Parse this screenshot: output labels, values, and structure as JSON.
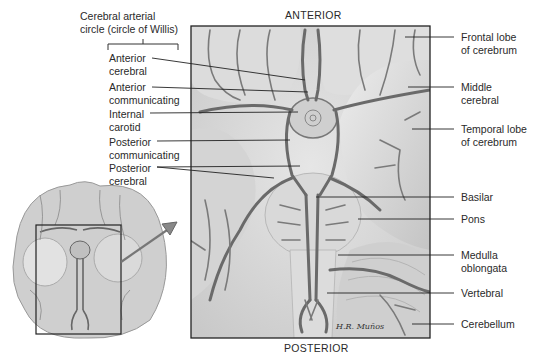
{
  "diagram": {
    "orientation": {
      "top": "ANTERIOR",
      "bottom": "POSTERIOR"
    },
    "group_title": "Cerebral arterial circle (circle of Willis)",
    "group_title_lines": [
      "Cerebral arterial",
      "circle (circle of Willis)"
    ],
    "left_labels": [
      {
        "lines": [
          "Anterior",
          "cerebral"
        ]
      },
      {
        "lines": [
          "Anterior",
          "communicating"
        ]
      },
      {
        "lines": [
          "Internal",
          "carotid"
        ]
      },
      {
        "lines": [
          "Posterior",
          "communicating"
        ]
      },
      {
        "lines": [
          "Posterior",
          "cerebral"
        ]
      }
    ],
    "right_labels": [
      {
        "lines": [
          "Frontal lobe",
          "of cerebrum"
        ]
      },
      {
        "lines": [
          "Middle",
          "cerebral"
        ]
      },
      {
        "lines": [
          "Temporal lobe",
          "of cerebrum"
        ]
      },
      {
        "lines": [
          "Basilar"
        ]
      },
      {
        "lines": [
          "Pons"
        ]
      },
      {
        "lines": [
          "Medulla",
          "oblongata"
        ]
      },
      {
        "lines": [
          "Vertebral"
        ]
      },
      {
        "lines": [
          "Cerebellum"
        ]
      }
    ],
    "signature": "H.R. Muños",
    "inset": "Inferior view of whole brain with highlighted region enlarged"
  }
}
